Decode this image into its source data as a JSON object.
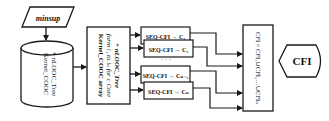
{
  "diagram": {
    "input": {
      "label": "minsup"
    },
    "database": {
      "line1": "Kernel_COOC",
      "line2": "+ nLOOC_Tree"
    },
    "partition": {
      "line1": "Kernel_COOC array",
      "line2": "form i₁ to iₙ for c Core",
      "line3": "+ nLOOC_Tree"
    },
    "workers": [
      {
        "label": "SEQ-CFI → C₁"
      },
      {
        "label": "SEQ-CFI → C₂"
      },
      {
        "label": "SEQ-CFI → Cₙ₋₁"
      },
      {
        "label": "SEQ-CFI → Cₙ"
      }
    ],
    "ellipsis": "· · ·",
    "merge": {
      "label": "CFI = CFI₁∪CFI₂…∪CFIₙ"
    },
    "output": {
      "label": "CFI"
    },
    "colors": {
      "stroke": "#1a1a1a",
      "background": "#ffffff"
    }
  }
}
